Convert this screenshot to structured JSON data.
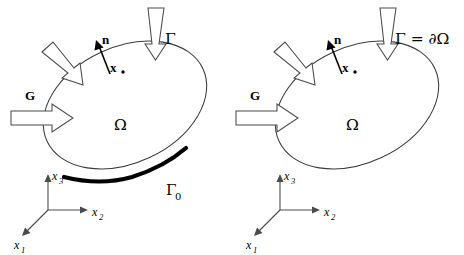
{
  "figure": {
    "background_color": "#ffffff",
    "panel_count": 2
  },
  "labels": {
    "boundary_gamma": "Γ",
    "boundary_gamma_eq": "Γ = ∂Ω",
    "boundary_gamma0_base": "Γ",
    "boundary_gamma0_sub": "0",
    "domain_omega": "Ω",
    "point_x": "x",
    "normal_n": "n",
    "load_g": "G",
    "axis_x1_base": "x",
    "axis_x1_sub": "1",
    "axis_x2_base": "x",
    "axis_x2_sub": "2",
    "axis_x3_base": "x",
    "axis_x3_sub": "3"
  },
  "panels": [
    {
      "id": "left",
      "name": "mixed-boundary-panel",
      "boundary_label": "Γ",
      "has_gamma0_segment": true,
      "gamma0_label_base": "Γ",
      "gamma0_label_sub": "0",
      "domain_label": "Ω",
      "point_label": "x",
      "normal_label": "n",
      "load_label": "G",
      "arrows": [
        "top-vertical-load",
        "upper-left-diagonal-load",
        "left-horizontal-load-G"
      ],
      "axes": [
        "x1",
        "x2",
        "x3"
      ]
    },
    {
      "id": "right",
      "name": "full-boundary-panel",
      "boundary_label": "Γ = ∂Ω",
      "has_gamma0_segment": false,
      "domain_label": "Ω",
      "point_label": "x",
      "normal_label": "n",
      "load_label": "G",
      "arrows": [
        "top-vertical-load",
        "upper-left-diagonal-load",
        "left-horizontal-load-G"
      ],
      "axes": [
        "x1",
        "x2",
        "x3"
      ]
    }
  ],
  "colors": {
    "outline": "#3a3a3a",
    "gamma0_thick": "#000000",
    "arrow_stroke": "#4a4a4a",
    "arrow_fill": "#ffffff",
    "text": "#000000",
    "axis": "#4a4a4a"
  },
  "geometry": {
    "ellipse_cx": 146,
    "ellipse_cy": 108,
    "ellipse_rx": 88,
    "ellipse_ry": 60,
    "ellipse_rotation_deg": -25,
    "axes_origin_x": 48,
    "axes_origin_y": 210
  }
}
